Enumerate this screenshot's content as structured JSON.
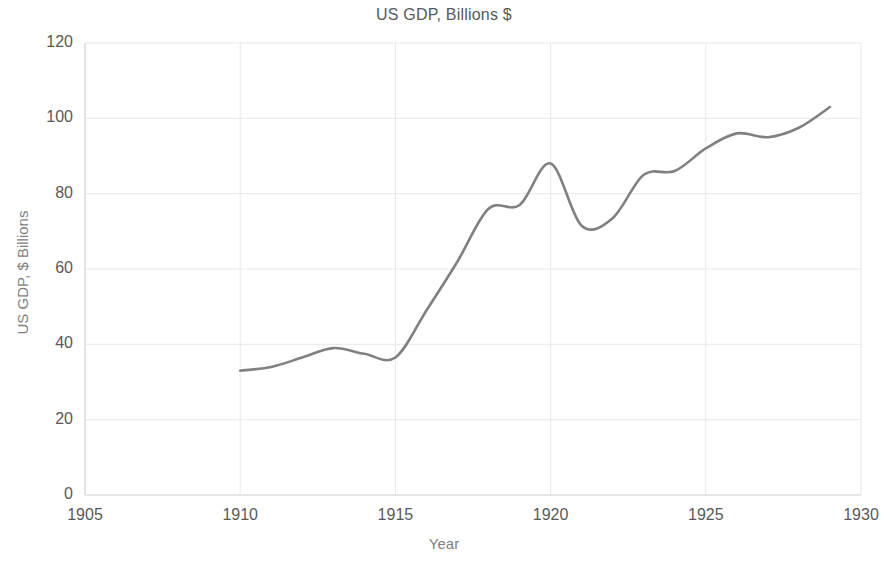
{
  "chart_data": {
    "type": "line",
    "title": "US GDP, Billions $",
    "xlabel": "Year",
    "ylabel": "US GDP, $ Billions",
    "xlim": [
      1905,
      1930
    ],
    "ylim": [
      0,
      120
    ],
    "x_ticks": [
      1905,
      1910,
      1915,
      1920,
      1925,
      1930
    ],
    "y_ticks": [
      0,
      20,
      40,
      60,
      80,
      100,
      120
    ],
    "grid": true,
    "legend": "none",
    "line_color": "#808080",
    "text_color": "#595959",
    "axis_title_color": "#7f7f7f",
    "grid_color": "#e8e8e8",
    "x": [
      1910,
      1911,
      1912,
      1913,
      1914,
      1915,
      1916,
      1917,
      1918,
      1919,
      1920,
      1921,
      1922,
      1923,
      1924,
      1925,
      1926,
      1927,
      1928,
      1929
    ],
    "values": [
      33,
      34,
      36.5,
      39,
      37.5,
      36.5,
      49,
      62,
      76,
      77,
      88,
      71.5,
      73.5,
      85,
      86,
      92,
      96,
      95,
      97.5,
      103
    ],
    "series": [
      {
        "name": "US GDP",
        "values": [
          33,
          34,
          36.5,
          39,
          37.5,
          36.5,
          49,
          62,
          76,
          77,
          88,
          71.5,
          73.5,
          85,
          86,
          92,
          96,
          95,
          97.5,
          103
        ]
      }
    ]
  },
  "axes": {
    "y_tick_labels": [
      "120",
      "100",
      "80",
      "60",
      "40",
      "20",
      "0"
    ],
    "x_tick_labels": [
      "1905",
      "1910",
      "1915",
      "1920",
      "1925",
      "1930"
    ]
  }
}
